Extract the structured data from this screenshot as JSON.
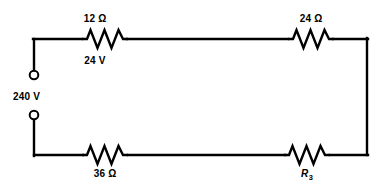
{
  "diagram": {
    "type": "electrical-schematic",
    "background_color": "#ffffff",
    "line_color": "#000000",
    "source": {
      "label": "240 V",
      "terminal_style": "open-circle",
      "terminals": 2
    },
    "components": [
      {
        "id": "r1",
        "symbol": "resistor",
        "label": "12 Ω",
        "label_position": "above",
        "branch": "top",
        "order": 1
      },
      {
        "id": "v1",
        "symbol": "voltage-drop-annotation",
        "label": "24 V",
        "label_position": "below",
        "branch": "top",
        "order": 1
      },
      {
        "id": "r2",
        "symbol": "resistor",
        "label": "24 Ω",
        "label_position": "above",
        "branch": "top",
        "order": 2
      },
      {
        "id": "r4",
        "symbol": "resistor",
        "label": "36 Ω",
        "label_position": "below",
        "branch": "bottom",
        "order": 1
      },
      {
        "id": "r3",
        "symbol": "resistor",
        "label": "R3",
        "label_base": "R",
        "label_subscript": "3",
        "label_position": "below",
        "branch": "bottom",
        "order": 2
      }
    ]
  }
}
